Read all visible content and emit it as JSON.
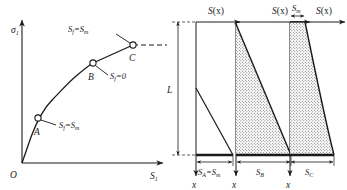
{
  "figure": {
    "background_color": "#ffffff",
    "line_color": "#1a1a1a",
    "fill_pattern_color": "#4a4a4a",
    "panels": [
      {
        "id": "stress-strain-panel",
        "y_axis_label": "σ",
        "y_axis_label_sub": "1",
        "x_axis_label": "S",
        "x_axis_label_sub": "1",
        "origin_label": "O",
        "points": [
          {
            "name": "A",
            "label": "A",
            "annotation": "S",
            "annotation_sub": "f",
            "annotation_rhs": "=S",
            "annotation_rhs_sub": "m"
          },
          {
            "name": "B",
            "label": "B",
            "annotation": "S",
            "annotation_sub": "f",
            "annotation_rhs": "=0",
            "annotation_rhs_sub": ""
          },
          {
            "name": "C",
            "label": "C",
            "annotation": "S",
            "annotation_sub": "f",
            "annotation_rhs": "=S",
            "annotation_rhs_sub": "m"
          }
        ]
      },
      {
        "id": "profile-panel-a",
        "top_label": "S",
        "top_label_paren": "(x)",
        "bottom_label": "S",
        "bottom_label_sub": "A",
        "bottom_label_rhs": "=S",
        "bottom_label_rhs_sub": "m",
        "depth_axis_label": "x",
        "length_label": "L",
        "shaded": false
      },
      {
        "id": "profile-panel-b",
        "top_label": "S",
        "top_label_paren": "(x)",
        "bottom_label": "S",
        "bottom_label_sub": "B",
        "bottom_label_rhs": "",
        "bottom_label_rhs_sub": "",
        "depth_axis_label": "x",
        "length_label": "",
        "shaded": true
      },
      {
        "id": "profile-panel-c",
        "top_label": "S",
        "top_label_paren": "(x)",
        "top_span_label": "S",
        "top_span_label_sub": "m",
        "bottom_label": "S",
        "bottom_label_sub": "C",
        "bottom_label_rhs": "",
        "bottom_label_rhs_sub": "",
        "depth_axis_label": "x",
        "length_label": "",
        "shaded": true
      }
    ]
  }
}
